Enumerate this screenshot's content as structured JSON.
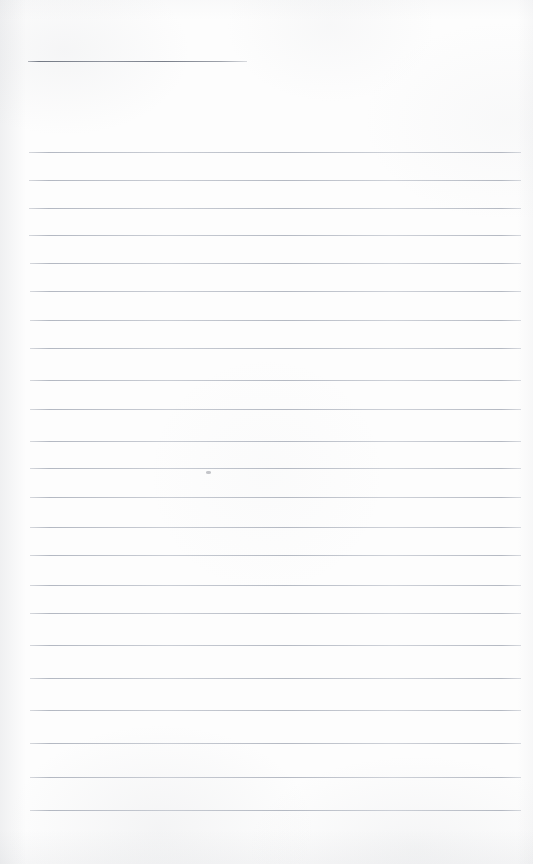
{
  "document": {
    "kind": "scanned-ruled-notebook-page",
    "title": "Blank ruled page",
    "written_text": "",
    "page_width": 533,
    "page_height": 864,
    "background_color": "#fdfdfd",
    "rule_color": "#a3a9b5",
    "header_rule_color": "#6f7580"
  },
  "header_rule": {
    "label": "header-rule",
    "x": 28,
    "y": 61,
    "width": 219,
    "thickness": 1
  },
  "rules": [
    {
      "label": "rule-1",
      "y": 152,
      "x": 29,
      "width": 492
    },
    {
      "label": "rule-2",
      "y": 180,
      "x": 29,
      "width": 492
    },
    {
      "label": "rule-3",
      "y": 208,
      "x": 29,
      "width": 492
    },
    {
      "label": "rule-4",
      "y": 235,
      "x": 29,
      "width": 492
    },
    {
      "label": "rule-5",
      "y": 263,
      "x": 30,
      "width": 491
    },
    {
      "label": "rule-6",
      "y": 291,
      "x": 30,
      "width": 491
    },
    {
      "label": "rule-7",
      "y": 320,
      "x": 30,
      "width": 491
    },
    {
      "label": "rule-8",
      "y": 348,
      "x": 30,
      "width": 491
    },
    {
      "label": "rule-9",
      "y": 380,
      "x": 30,
      "width": 491
    },
    {
      "label": "rule-10",
      "y": 409,
      "x": 30,
      "width": 491
    },
    {
      "label": "rule-11",
      "y": 441,
      "x": 30,
      "width": 491
    },
    {
      "label": "rule-12",
      "y": 468,
      "x": 30,
      "width": 491
    },
    {
      "label": "rule-13",
      "y": 497,
      "x": 30,
      "width": 491
    },
    {
      "label": "rule-14",
      "y": 527,
      "x": 30,
      "width": 491
    },
    {
      "label": "rule-15",
      "y": 555,
      "x": 30,
      "width": 491
    },
    {
      "label": "rule-16",
      "y": 585,
      "x": 30,
      "width": 491
    },
    {
      "label": "rule-17",
      "y": 613,
      "x": 30,
      "width": 491
    },
    {
      "label": "rule-18",
      "y": 645,
      "x": 30,
      "width": 491
    },
    {
      "label": "rule-19",
      "y": 678,
      "x": 30,
      "width": 491
    },
    {
      "label": "rule-20",
      "y": 710,
      "x": 30,
      "width": 491
    },
    {
      "label": "rule-21",
      "y": 743,
      "x": 30,
      "width": 491
    },
    {
      "label": "rule-22",
      "y": 777,
      "x": 30,
      "width": 491
    },
    {
      "label": "rule-23",
      "y": 810,
      "x": 30,
      "width": 491
    }
  ],
  "artifacts": [
    {
      "label": "ink-speck",
      "x": 206,
      "y": 471,
      "width": 5,
      "height": 3
    }
  ]
}
